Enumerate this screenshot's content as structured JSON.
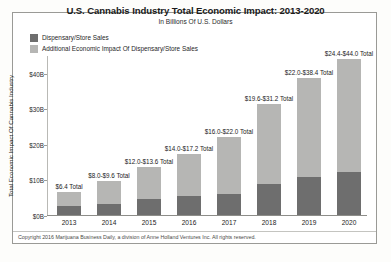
{
  "header": {
    "title": "U.S. Cannabis Industry Total Economic Impact: 2013-2020",
    "subtitle": "In Billions Of U.S. Dollars"
  },
  "footer": {
    "copyright": "Copyright 2016 Marijuana Business Daily, a division of Anne Holland Ventures Inc. All rights reserved."
  },
  "colors": {
    "series_dispensary": "#6e6e6e",
    "series_additional": "#b6b6b4",
    "frame": "#9a9a96",
    "axis": "#8d8d89",
    "text": "#1b1b1b",
    "paper": "#ffffff"
  },
  "chart_data": {
    "type": "bar",
    "subtype": "stacked-bar",
    "title": "U.S. Cannabis Industry Total Economic Impact: 2013-2020",
    "subtitle": "In Billions Of U.S. Dollars",
    "xlabel": "",
    "ylabel": "Total Economic Impact Of Cannabis Industry",
    "ylim": [
      0,
      45
    ],
    "yticks": [
      0,
      10,
      20,
      30,
      40
    ],
    "ytick_labels": [
      "$0B",
      "$10B",
      "$20B",
      "$30B",
      "$40B"
    ],
    "grid": false,
    "legend_position": "top-left",
    "categories": [
      "2013",
      "2014",
      "2015",
      "2016",
      "2017",
      "2018",
      "2019",
      "2020"
    ],
    "series": [
      {
        "name": "Dispensary/Store Sales",
        "color": "#6e6e6e",
        "values": [
          2.5,
          3.2,
          4.4,
          5.4,
          5.9,
          8.6,
          10.6,
          12.1
        ]
      },
      {
        "name": "Additional Economic Impact Of Dispensary/Store Sales",
        "color": "#b6b6b4",
        "values": [
          3.9,
          6.4,
          9.2,
          11.8,
          16.1,
          22.6,
          27.8,
          31.9
        ]
      }
    ],
    "bar_labels": [
      "$6.4 Total",
      "$8.0-$9.6 Total",
      "$12.0-$13.6 Total",
      "$14.0-$17.2 Total",
      "$16.0-$22.0 Total",
      "$19.6-$31.2 Total",
      "$22.0-$38.4 Total",
      "$24.4-$44.0 Total"
    ],
    "totals": [
      6.4,
      9.6,
      13.6,
      17.2,
      22.0,
      31.2,
      38.4,
      44.0
    ]
  },
  "legend": {
    "items": [
      {
        "label": "Dispensary/Store Sales",
        "color": "#6e6e6e"
      },
      {
        "label": "Additional Economic Impact Of Dispensary/Store Sales",
        "color": "#b6b6b4"
      }
    ]
  }
}
